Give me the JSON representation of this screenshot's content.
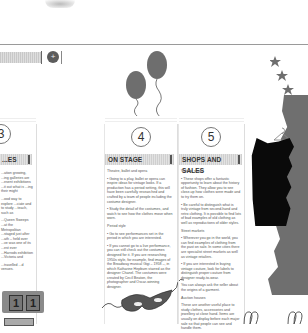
{
  "document": {
    "type": "exhibition brochure (scanned)",
    "header_icon": "plus-circle-icon"
  },
  "panels": [
    {
      "number": "3",
      "title": "...ES",
      "paragraphs": [
        "...ation growing, ...ing galleries are ...esent exhibitions ...it out what is ...ing their might",
        "...ood way to explore ...ciate and to study ...teach, such as",
        "...Queen Sweeps ...at the Metropolitan ...staged just after ...ath – held over ...ve was one of its ...est ever ...Harrods exhibition ...Victoria and",
        "...travelled ...d venues."
      ],
      "image": "ticket-stub",
      "ticket_digits": [
        "1",
        "1"
      ]
    },
    {
      "number": "4",
      "title": "ON STAGE",
      "paragraphs": [
        "Theatre, ballet and opera",
        "• Going to a play, ballet or opera can inspire ideas for vintage looks. If a production has a period setting, this will have been carefully researched and crafted by a team of people including the costume designer.",
        "• Study the detail of the costumes, and watch to see how the clothes move when worn.",
        "Period style",
        "• Go to see performances set in the period in which you are interested.",
        "• If you cannot go to a live performance, you can still check out the costumes designed for it. If you are researching 1950s style, for example, find images of the Broadway musical Gigi – 1958 –, in which Katharine Hepburn starred as the designer Chanel. The costumes were created by Cecil Beaton, the photographer and Oscar-winning designer."
      ],
      "image": "masquerade-mask"
    },
    {
      "number": "5",
      "title": "SHOPS AND SALES",
      "paragraphs": [
        "Vintage shops",
        "• These shops offer a fantastic opportunity to learn about the history of fashion. They allow you to see close-up how clothes were made and to try them on.",
        "• Be careful to distinguish what is truly vintage from second-hand and retro clothing. It is possible to find lots of bad examples of old clothing as well as reproductions of older styles.",
        "Street markets",
        "• Wherever you go in the world, you can find examples of clothing from the past on sale. In some cities there are specialist street markets as well as vintage retailers.",
        "• If you are interested in buying vintage couture, look for labels to distinguish proper couture from designer ready-to-wear.",
        "You can always ask the seller about the origins of a garment.",
        "Auction houses",
        "These are another useful place to study clothes, accessories and jewellery at close hand. Items are usually on display before each major sale so that people can see and handle them."
      ]
    }
  ],
  "decorations": {
    "balloons": 2,
    "stars": 3,
    "dresses": [
      "black-dress-on-hanger",
      "gray-dress"
    ]
  },
  "colors": {
    "page": "#ffffff",
    "text": "#444444",
    "header_bar": "#d6d6d6",
    "balloon": "#6e6e6e",
    "dress_black": "#0a0a0a",
    "dress_gray": "#6f6f6f"
  }
}
